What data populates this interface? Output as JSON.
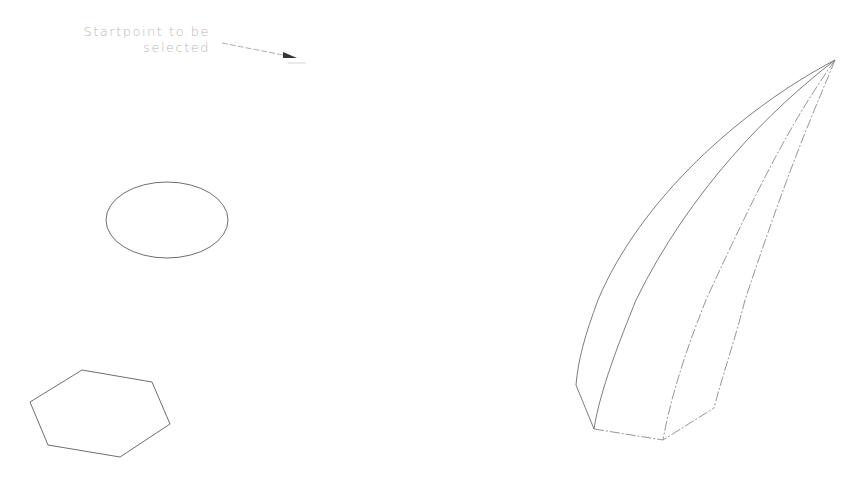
{
  "annotation": {
    "line1": "Startpoint to be",
    "line2": "selected"
  },
  "colors": {
    "background": "#ffffff",
    "stroke": "#6e6e6e",
    "text": "#b8b8b8"
  },
  "shapes": [
    {
      "name": "ellipse",
      "type": "profile"
    },
    {
      "name": "hexagon",
      "type": "profile"
    },
    {
      "name": "loft",
      "type": "lofted-solid-result"
    }
  ]
}
